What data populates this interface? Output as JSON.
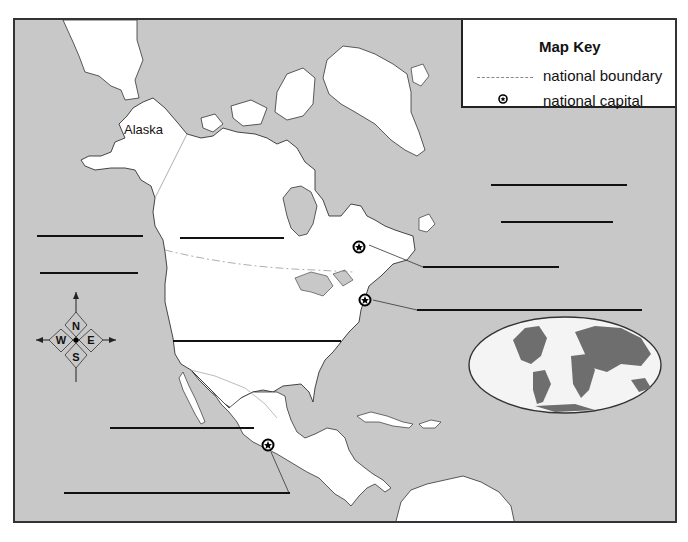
{
  "map": {
    "title": "North America outline map",
    "region_labels": {
      "alaska": "Alaska"
    },
    "colors": {
      "water": "#c8c8c8",
      "land": "#ffffff",
      "outline": "#333333",
      "boundary": "#999999",
      "globe_land": "#6e6e6e"
    }
  },
  "key": {
    "title": "Map Key",
    "items": [
      {
        "icon": "national-boundary-line",
        "label": "national boundary"
      },
      {
        "icon": "star-in-circle",
        "label": "national capital"
      }
    ]
  },
  "compass": {
    "n": "N",
    "s": "S",
    "e": "E",
    "w": "W"
  },
  "answer_blanks": [
    {
      "id": "blank-1",
      "x": 22,
      "y": 215,
      "w": 106
    },
    {
      "id": "blank-2",
      "x": 25,
      "y": 252,
      "w": 98
    },
    {
      "id": "blank-3",
      "x": 165,
      "y": 217,
      "w": 104
    },
    {
      "id": "blank-4",
      "x": 476,
      "y": 164,
      "w": 136
    },
    {
      "id": "blank-5",
      "x": 486,
      "y": 201,
      "w": 112
    },
    {
      "id": "blank-6",
      "x": 408,
      "y": 246,
      "w": 136
    },
    {
      "id": "blank-7",
      "x": 402,
      "y": 289,
      "w": 225
    },
    {
      "id": "blank-8",
      "x": 158,
      "y": 320,
      "w": 168
    },
    {
      "id": "blank-9",
      "x": 95,
      "y": 407,
      "w": 144
    },
    {
      "id": "blank-10",
      "x": 49,
      "y": 472,
      "w": 226
    }
  ],
  "capitals": [
    {
      "name": "Ottawa",
      "x": 344,
      "y": 227
    },
    {
      "name": "Washington D.C.",
      "x": 350,
      "y": 280
    },
    {
      "name": "Mexico City",
      "x": 253,
      "y": 425
    }
  ]
}
